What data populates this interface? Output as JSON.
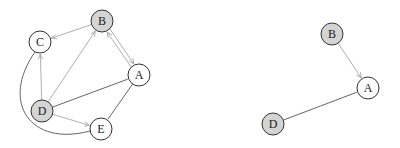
{
  "colors": {
    "node_stroke": "#333333",
    "node_fill_white": "#ffffff",
    "node_fill_gray": "#d4d4d4",
    "edge_directed": "#b0b0b0",
    "edge_undirected": "#666666"
  },
  "graphs": [
    {
      "id": "left",
      "nodes": [
        {
          "id": "A",
          "label": "A",
          "x": 139,
          "y": 75,
          "fill": "white"
        },
        {
          "id": "B",
          "label": "B",
          "x": 102,
          "y": 21,
          "fill": "gray"
        },
        {
          "id": "C",
          "label": "C",
          "x": 40,
          "y": 42,
          "fill": "white"
        },
        {
          "id": "D",
          "label": "D",
          "x": 42,
          "y": 111,
          "fill": "gray"
        },
        {
          "id": "E",
          "label": "E",
          "x": 101,
          "y": 129,
          "fill": "white"
        }
      ],
      "edges": [
        {
          "from": "B",
          "to": "C",
          "directed": true
        },
        {
          "from": "B",
          "to": "A",
          "directed": true,
          "offset": -2
        },
        {
          "from": "A",
          "to": "B",
          "directed": true,
          "offset": -2
        },
        {
          "from": "D",
          "to": "C",
          "directed": true
        },
        {
          "from": "D",
          "to": "B",
          "directed": true
        },
        {
          "from": "D",
          "to": "E",
          "directed": true
        },
        {
          "from": "D",
          "to": "A",
          "directed": false
        },
        {
          "from": "A",
          "to": "E",
          "directed": false
        },
        {
          "from": "C",
          "to": "E",
          "directed": false,
          "curve": true
        }
      ]
    },
    {
      "id": "right",
      "nodes": [
        {
          "id": "A",
          "label": "A",
          "x": 368,
          "y": 88,
          "fill": "white"
        },
        {
          "id": "B",
          "label": "B",
          "x": 332,
          "y": 34,
          "fill": "gray"
        },
        {
          "id": "D",
          "label": "D",
          "x": 273,
          "y": 124,
          "fill": "gray"
        }
      ],
      "edges": [
        {
          "from": "B",
          "to": "A",
          "directed": true
        },
        {
          "from": "D",
          "to": "A",
          "directed": false
        }
      ]
    }
  ],
  "node_radius": 11
}
